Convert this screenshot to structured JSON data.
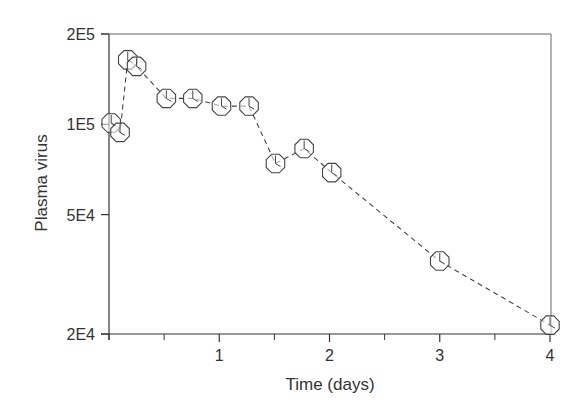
{
  "chart_data": {
    "type": "line",
    "title": "",
    "xlabel": "Time (days)",
    "ylabel": "Plasma virus",
    "xlim": [
      0,
      4
    ],
    "ylim": [
      20000,
      200000
    ],
    "yscale": "log",
    "grid": false,
    "legend": null,
    "x_ticks": [
      1,
      2,
      3,
      4
    ],
    "x_minor_ticks": [
      0,
      0.5,
      1.5,
      2.5,
      3.5
    ],
    "y_ticks": [
      {
        "value": 200000,
        "label": "2E5"
      },
      {
        "value": 100000,
        "label": "1E5"
      },
      {
        "value": 50000,
        "label": "5E4"
      },
      {
        "value": 20000,
        "label": "2E4"
      }
    ],
    "series": [
      {
        "name": "Plasma virus",
        "line_style": "dashed",
        "marker": "octagon",
        "x": [
          0.02,
          0.1,
          0.17,
          0.25,
          0.52,
          0.76,
          1.02,
          1.27,
          1.51,
          1.77,
          2.02,
          3.0,
          4.0
        ],
        "values": [
          101000,
          94000,
          164000,
          156000,
          122000,
          122000,
          115000,
          115000,
          74000,
          83000,
          69000,
          35000,
          21400
        ]
      }
    ]
  },
  "axes": {
    "xlabel": "Time (days)",
    "ylabel": "Plasma virus",
    "x_tick_labels": [
      "1",
      "2",
      "3",
      "4"
    ],
    "y_tick_labels": [
      "2E5",
      "1E5",
      "5E4",
      "2E4"
    ]
  },
  "colors": {
    "axis": "#333333",
    "line": "#444444",
    "marker": "#444444"
  }
}
